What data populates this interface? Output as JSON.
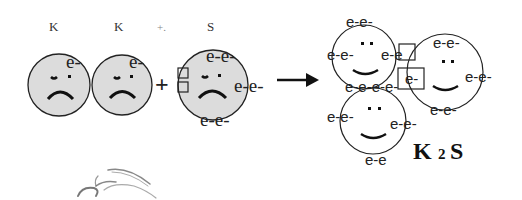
{
  "diagram": {
    "title_labels": [
      {
        "text": "K",
        "x": 49,
        "y": 31
      },
      {
        "text": "K",
        "x": 114,
        "y": 31
      },
      {
        "text": "+.",
        "x": 157,
        "y": 31
      },
      {
        "text": "S",
        "x": 207,
        "y": 31
      }
    ],
    "plus_sign": "+",
    "colors": {
      "atom_fill": "#dcdcdc",
      "stroke": "#222222",
      "product_fill": "#ffffff"
    },
    "reactants": {
      "k1": {
        "electrons": "e-"
      },
      "k2": {
        "electrons": "e-"
      },
      "s": {
        "top": "e-e-",
        "right": "e-e-",
        "bottom": "e-e-"
      }
    },
    "products": {
      "k_top": {
        "top": "e-e-",
        "left": "e-e-",
        "right": "e-e",
        "bottom": "e-e-e-e-"
      },
      "s_right": {
        "top": "e-e-",
        "right": "e-e-",
        "bottom": "e-e-",
        "box": "e-"
      },
      "k_bottom": {
        "left": "e-e-",
        "right": "e-e-",
        "bottom": "e-e"
      }
    },
    "formula": {
      "k": "K",
      "sub": "2",
      "s": "S"
    }
  }
}
